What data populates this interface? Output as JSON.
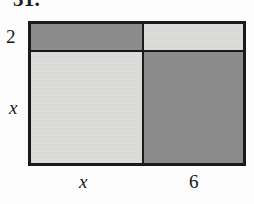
{
  "problem": {
    "number": "31."
  },
  "figure": {
    "type": "area-model-rectangle",
    "colors": {
      "dark_fill": "#8c8c8c",
      "light_fill": "#dededc",
      "outline": "#1a1a1a",
      "background": "#fdfdfd",
      "text": "#151515"
    },
    "labels": {
      "height_top": "2",
      "height_bottom": "x",
      "width_left": "x",
      "width_right": "6"
    },
    "cells": [
      {
        "row": 0,
        "col": 0,
        "shade": "dark",
        "width_label": "x",
        "height_label": "2"
      },
      {
        "row": 0,
        "col": 1,
        "shade": "light",
        "width_label": "6",
        "height_label": "2"
      },
      {
        "row": 1,
        "col": 0,
        "shade": "light",
        "width_label": "x",
        "height_label": "x"
      },
      {
        "row": 1,
        "col": 1,
        "shade": "dark",
        "width_label": "6",
        "height_label": "x"
      }
    ]
  }
}
